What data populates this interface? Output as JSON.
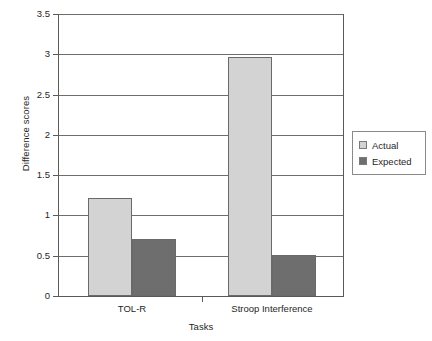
{
  "chart_data": {
    "type": "bar",
    "title": "",
    "xlabel": "Tasks",
    "ylabel": "Difference scores",
    "categories": [
      "TOL-R",
      "Stroop Interference"
    ],
    "series": [
      {
        "name": "Actual",
        "color": "#d3d3d3",
        "values": [
          1.22,
          2.97
        ]
      },
      {
        "name": "Expected",
        "color": "#6e6e6e",
        "values": [
          0.71,
          0.51
        ]
      }
    ],
    "ylim": [
      0,
      3.5
    ],
    "yticks": [
      "0",
      "0.5",
      "1",
      "1.5",
      "2",
      "2.5",
      "3",
      "3.5"
    ],
    "ytick_values": [
      0,
      0.5,
      1,
      1.5,
      2,
      2.5,
      3,
      3.5
    ],
    "grid": true,
    "legend_position": "right"
  },
  "legend": {
    "entries": [
      {
        "label": "Actual"
      },
      {
        "label": "Expected"
      }
    ]
  }
}
